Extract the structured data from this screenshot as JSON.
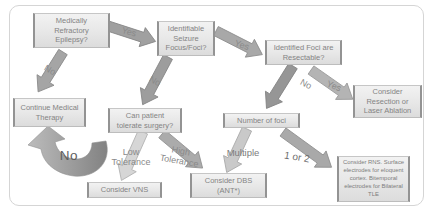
{
  "figure_type": "flowchart",
  "topic": "Epilepsy surgical treatment decision pathway",
  "colors": {
    "background": "#ffffff",
    "panel_border": "#d5d5d5",
    "box_fill": "#e7e7e7",
    "box_edge_dark": "#939393",
    "box_text": "#848484",
    "arrow_gray": "#a0a0a0",
    "arrow_light_gray": "#d6d6d6",
    "label_text": "#8a8a8a"
  },
  "nodes": {
    "medically_refractory": "Medically\nRefractory\nEpilepsy?",
    "identifiable_focus": "Identifiable\nSeizure\nFocus/Foci?",
    "identified_foci": "Identified Foci are\nResectable?",
    "continue_medical": "Continue Medical\nTherapy",
    "tolerate_surgery": "Can patient\ntolerate surgery?",
    "number_of_foci": "Number of foci",
    "consider_resection": "Consider\nResection or\nLaser Ablation",
    "consider_vns": "Consider VNS",
    "consider_dbs": "Consider DBS\n(ANT*)",
    "consider_rns": "Consider RNS. Surface\nelectrodes for eloquent\ncortex. Bitemporal\nelectrodes for Bilateral\nTLE"
  },
  "edges": {
    "yes_refractory": "Yes",
    "no_refractory": "No",
    "no_focus": "No",
    "yes_focus": "Yes",
    "no_resectable": "No",
    "yes_resectable": "Yes",
    "no_tolerate": "No",
    "low_tolerance": "Low\nTolerance",
    "high_tolerance": "High\nTolerance",
    "multiple": "Multiple",
    "one_or_two": "1 or 2"
  }
}
